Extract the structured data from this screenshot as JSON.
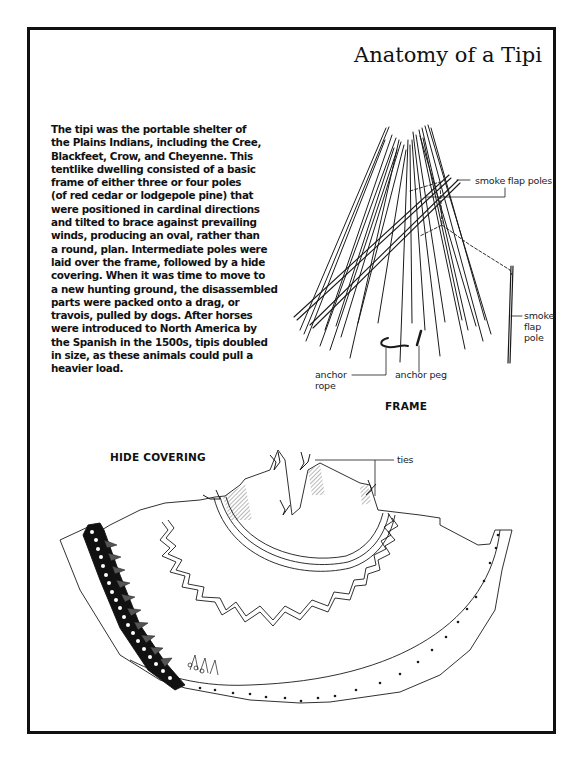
{
  "page": {
    "title": "Anatomy of a Tipi",
    "intro_lines": [
      "The tipi was the portable shelter of",
      "the Plains Indians, including the Cree,",
      "Blackfeet, Crow, and Cheyenne. This",
      "tentlike dwelling consisted of a basic",
      "frame of either three or four poles",
      "(of red cedar or lodgepole pine) that",
      "were positioned in cardinal directions",
      "and tilted to brace against prevailing",
      "winds, producing an oval, rather than",
      "a round, plan. Intermediate poles were",
      "laid over the frame, followed by a hide",
      "covering. When it was time to move to",
      "a new hunting ground, the disassembled",
      "parts were packed onto a drag, or",
      "travois, pulled by dogs. After horses",
      "were introduced to North America by",
      "the Spanish in the 1500s, tipis doubled",
      "in size, as these animals could pull a",
      "heavier load."
    ]
  },
  "frame_diagram": {
    "caption": "FRAME",
    "labels": {
      "smoke_flap_poles": "smoke flap poles",
      "smoke_flap_pole_1": "smoke",
      "smoke_flap_pole_2": "flap",
      "smoke_flap_pole_3": "pole",
      "anchor_rope_1": "anchor",
      "anchor_rope_2": "rope",
      "anchor_peg": "anchor peg"
    }
  },
  "hide_diagram": {
    "caption": "HIDE COVERING",
    "labels": {
      "ties": "ties"
    }
  }
}
